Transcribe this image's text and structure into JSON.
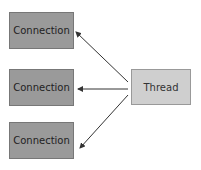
{
  "diagram": {
    "connections": [
      {
        "label": "Connection"
      },
      {
        "label": "Connection"
      },
      {
        "label": "Connection"
      }
    ],
    "thread": {
      "label": "Thread"
    },
    "edges": [
      {
        "from": "Thread",
        "to": "Connection 1"
      },
      {
        "from": "Thread",
        "to": "Connection 2"
      },
      {
        "from": "Thread",
        "to": "Connection 3"
      }
    ],
    "colors": {
      "connection_fill": "#9a9a9a",
      "thread_fill": "#cfcfcf",
      "arrow": "#333333"
    }
  }
}
